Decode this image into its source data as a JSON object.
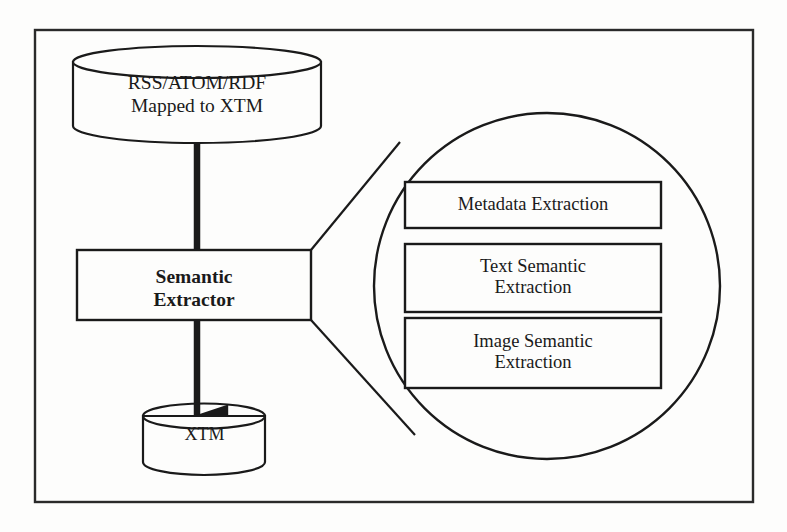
{
  "figure": {
    "background_color": "#fdfdfc",
    "stroke_color": "#1a1a1a",
    "frame": {
      "name": "outer-frame",
      "x": 35,
      "y": 30,
      "width": 718,
      "height": 472
    }
  },
  "source_store": {
    "label": "RSS/ATOM/RDF\nMapped to XTM",
    "shape": "cylinder"
  },
  "processor": {
    "label": "Semantic\nExtractor",
    "shape": "rectangle"
  },
  "sink_store": {
    "label": "XTM",
    "shape": "cylinder"
  },
  "callout": {
    "shape": "circle",
    "sub_boxes": [
      {
        "label": "Metadata Extraction"
      },
      {
        "label": "Text Semantic\nExtraction"
      },
      {
        "label": "Image Semantic\nExtraction"
      }
    ]
  },
  "connectors": [
    {
      "name": "source-to-processor",
      "from": "source_store",
      "to": "processor",
      "arrowhead": false
    },
    {
      "name": "processor-to-sink",
      "from": "processor",
      "to": "sink_store",
      "arrowhead": true
    },
    {
      "name": "callout-line-upper",
      "from": "processor",
      "to": "callout"
    },
    {
      "name": "callout-line-lower",
      "from": "processor",
      "to": "callout"
    }
  ]
}
